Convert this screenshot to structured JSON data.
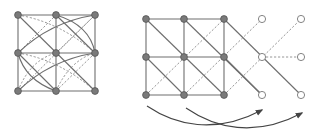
{
  "diagram": {
    "colors": {
      "edge_solid": "#6e6e6e",
      "edge_dashed": "#8a8a8a",
      "node_filled": "#7a7a7a",
      "node_open_stroke": "#777777",
      "arrow": "#444444"
    },
    "left_graph": {
      "nodes": [
        {
          "x": 18,
          "y": 15,
          "type": "filled"
        },
        {
          "x": 56,
          "y": 15,
          "type": "filled"
        },
        {
          "x": 95,
          "y": 15,
          "type": "filled"
        },
        {
          "x": 18,
          "y": 53,
          "type": "filled"
        },
        {
          "x": 56,
          "y": 53,
          "type": "filled"
        },
        {
          "x": 95,
          "y": 53,
          "type": "filled"
        },
        {
          "x": 18,
          "y": 91,
          "type": "filled"
        },
        {
          "x": 56,
          "y": 91,
          "type": "filled"
        },
        {
          "x": 95,
          "y": 91,
          "type": "filled"
        }
      ],
      "solid_edges": [
        "M18 15 L95 15",
        "M18 53 L95 53",
        "M18 91 L95 91",
        "M18 15 L18 91",
        "M56 15 L56 91",
        "M95 15 L95 91",
        "M18 15 L95 91",
        "M56 15 L95 53",
        "M18 53 L56 91",
        "M95 15 Q50 22 18 53",
        "M95 53 Q50 60 18 91",
        "M56 15 Q90 25 95 53",
        "M18 53 Q25 80 56 91"
      ],
      "dashed_edges": [
        "M18 53 L56 15",
        "M56 53 L95 15",
        "M18 91 L95 15",
        "M56 91 L95 53",
        "M18 15 Q60 22 95 53",
        "M18 53 Q60 60 95 91",
        "M18 91 Q30 60 56 53",
        "M56 91 Q70 60 95 53"
      ]
    },
    "right_graph": {
      "nodes": [
        {
          "x": 146,
          "y": 19,
          "type": "filled"
        },
        {
          "x": 184,
          "y": 19,
          "type": "filled"
        },
        {
          "x": 224,
          "y": 19,
          "type": "filled"
        },
        {
          "x": 146,
          "y": 57,
          "type": "filled"
        },
        {
          "x": 184,
          "y": 57,
          "type": "filled"
        },
        {
          "x": 224,
          "y": 57,
          "type": "filled"
        },
        {
          "x": 146,
          "y": 95,
          "type": "filled"
        },
        {
          "x": 184,
          "y": 95,
          "type": "filled"
        },
        {
          "x": 224,
          "y": 95,
          "type": "filled"
        },
        {
          "x": 262,
          "y": 19,
          "type": "open"
        },
        {
          "x": 301,
          "y": 19,
          "type": "open"
        },
        {
          "x": 262,
          "y": 57,
          "type": "open"
        },
        {
          "x": 301,
          "y": 57,
          "type": "open"
        },
        {
          "x": 262,
          "y": 95,
          "type": "open"
        },
        {
          "x": 301,
          "y": 95,
          "type": "open"
        }
      ],
      "solid_edges": [
        "M146 19 L224 19",
        "M146 57 L224 57",
        "M146 95 L224 95",
        "M146 19 L146 95",
        "M184 19 L184 95",
        "M224 19 L224 95",
        "M146 19 L224 95",
        "M184 19 L262 95",
        "M224 19 L301 95",
        "M146 57 L184 95",
        "M224 57 L262 95"
      ],
      "dashed_edges": [
        "M146 95 L224 19",
        "M184 95 L262 19",
        "M224 95 L301 19",
        "M262 57 L301 57"
      ],
      "hidden_dashed_note": "middle open node row has no horizontal line"
    },
    "arrows": [
      {
        "path": "M147 106 C 175 125, 215 135, 262 110",
        "tip": {
          "x": 263,
          "y": 109
        }
      },
      {
        "path": "M186 108 C 215 128, 255 138, 302 113",
        "tip": {
          "x": 303,
          "y": 112
        }
      }
    ]
  }
}
